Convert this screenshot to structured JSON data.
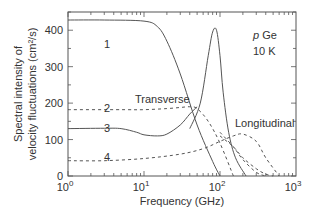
{
  "chart_data": {
    "type": "line",
    "title": "",
    "xlabel": "Frequency (GHz)",
    "ylabel_line1": "Spectral intensity of",
    "ylabel_line2": "velocity fluctuations (cm²/s)",
    "xscale": "log",
    "xlim": [
      1,
      1000
    ],
    "ylim": [
      0,
      450
    ],
    "x_ticks": [
      {
        "base": "10",
        "exp": "0",
        "value": 1
      },
      {
        "base": "10",
        "exp": "1",
        "value": 10
      },
      {
        "base": "10",
        "exp": "2",
        "value": 100
      },
      {
        "base": "10",
        "exp": "3",
        "value": 1000
      }
    ],
    "y_ticks": [
      "0",
      "100",
      "200",
      "300",
      "400"
    ],
    "y_tick_values": [
      0,
      100,
      200,
      300,
      400
    ],
    "grid": false,
    "annotations": {
      "material_italic": "p",
      "material": " Ge",
      "temperature": "10 K",
      "transverse": "Transverse",
      "longitudinal": "Longitudinal"
    },
    "series": [
      {
        "name": "1",
        "style": "solid",
        "group": "Transverse",
        "x": [
          1,
          3,
          10,
          15,
          20,
          30,
          50,
          80,
          100
        ],
        "y": [
          428,
          428,
          425,
          410,
          370,
          280,
          140,
          40,
          0
        ]
      },
      {
        "name": "1",
        "style": "solid",
        "group": "Longitudinal (peak)",
        "x": [
          40,
          55,
          70,
          80,
          90,
          100,
          110,
          130,
          160,
          220
        ],
        "y": [
          130,
          200,
          330,
          395,
          400,
          330,
          230,
          120,
          50,
          0
        ]
      },
      {
        "name": "2",
        "style": "dashed",
        "group": "Transverse",
        "x": [
          1,
          5,
          10,
          20,
          30,
          40,
          50,
          70,
          100,
          150
        ],
        "y": [
          182,
          182,
          182,
          185,
          188,
          190,
          185,
          150,
          90,
          0
        ]
      },
      {
        "name": "2",
        "style": "dashed",
        "group": "Longitudinal",
        "x": [
          100,
          150,
          200,
          300,
          400,
          500
        ],
        "y": [
          110,
          80,
          50,
          20,
          5,
          0
        ]
      },
      {
        "name": "3",
        "style": "solid",
        "group": "Transverse",
        "x": [
          1,
          3,
          5,
          8,
          10,
          15,
          20,
          30,
          40,
          50
        ],
        "y": [
          130,
          131,
          130,
          120,
          113,
          110,
          115,
          140,
          170,
          190
        ]
      },
      {
        "name": "3",
        "style": "dashed",
        "group": "Longitudinal",
        "x": [
          100,
          150,
          200,
          300,
          400
        ],
        "y": [
          120,
          80,
          45,
          10,
          0
        ]
      },
      {
        "name": "4",
        "style": "dashed",
        "x": [
          1,
          3,
          10,
          30,
          60,
          100,
          150,
          200,
          300,
          400,
          600
        ],
        "y": [
          42,
          42,
          48,
          60,
          75,
          95,
          110,
          115,
          95,
          50,
          0
        ]
      }
    ],
    "curve_labels": [
      {
        "text": "1",
        "x": 3,
        "y": 400
      },
      {
        "text": "2",
        "x": 3,
        "y": 195
      },
      {
        "text": "3",
        "x": 3,
        "y": 145
      },
      {
        "text": "4",
        "x": 3,
        "y": 60
      }
    ]
  }
}
